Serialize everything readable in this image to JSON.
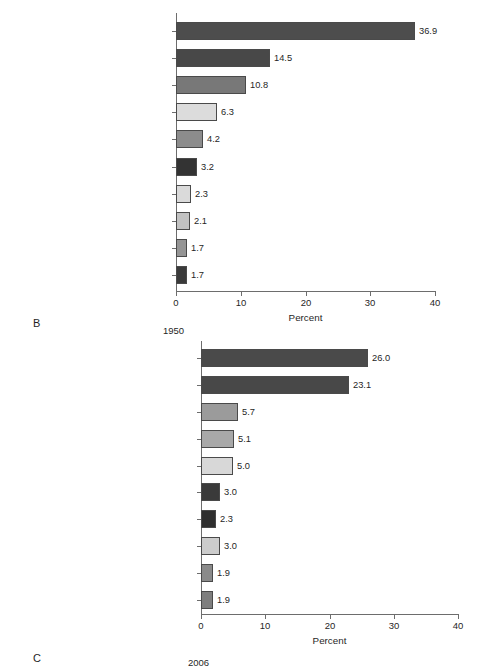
{
  "figure": {
    "panels": [
      {
        "letter": "B",
        "year_caption": "1950",
        "xlabel": "Percent",
        "xticks": [
          "0",
          "10",
          "20",
          "30",
          "40"
        ]
      },
      {
        "letter": "C",
        "year_caption": "2006",
        "xlabel": "Percent",
        "xticks": [
          "0",
          "10",
          "20",
          "30",
          "40"
        ]
      }
    ]
  },
  "chart_data": [
    {
      "type": "bar",
      "orientation": "horizontal",
      "title": "1950",
      "panel_letter": "B",
      "xlabel": "Percent",
      "ylabel": "",
      "xlim": [
        0,
        40
      ],
      "xticks": [
        0,
        10,
        20,
        30,
        40
      ],
      "grid": false,
      "legend": "none",
      "categories": [
        "Disease of the heart",
        "Malignant neoplasms",
        "CNS vascular lesions",
        "Accidents",
        "Certain diseases of early infancy",
        "Influenza and pneumonia",
        "Tuberculosis",
        "General arteriosclerosis",
        "Nephritis and renal sclerosis",
        "Diabetes mellitus"
      ],
      "values": [
        36.9,
        14.5,
        10.8,
        6.3,
        4.2,
        3.2,
        2.3,
        2.1,
        1.7,
        1.7
      ],
      "value_labels": [
        "36.9",
        "14.5",
        "10.8",
        "6.3",
        "4.2",
        "3.2",
        "2.3",
        "2.1",
        "1.7",
        "1.7"
      ],
      "bar_colors": [
        "#4d4d4d",
        "#484848",
        "#787878",
        "#dcdcdc",
        "#8c8c8c",
        "#333333",
        "#dadada",
        "#c2c2c2",
        "#959595",
        "#3a3a3a"
      ]
    },
    {
      "type": "bar",
      "orientation": "horizontal",
      "title": "2006",
      "panel_letter": "C",
      "xlabel": "Percent",
      "ylabel": "",
      "xlim": [
        0,
        40
      ],
      "xticks": [
        0,
        10,
        20,
        30,
        40
      ],
      "grid": false,
      "legend": "none",
      "categories": [
        "Heart diseases",
        "Malignant neoplasms",
        "Cerebrovascular diseases",
        "Chronic lower respiratory diseases",
        "Accidents",
        "Diabetes mellitus",
        "Influenza and pneumonia",
        "Alzheimer's disease",
        "Nephritis, nephrotic syndrome, nephrosis",
        "Septicemia"
      ],
      "values": [
        26.0,
        23.1,
        5.7,
        5.1,
        5.0,
        3.0,
        2.3,
        3.0,
        1.9,
        1.9
      ],
      "value_labels": [
        "26.0",
        "23.1",
        "5.7",
        "5.1",
        "5.0",
        "3.0",
        "2.3",
        "3.0",
        "1.9",
        "1.9"
      ],
      "bar_colors": [
        "#4a4a4a",
        "#484848",
        "#9b9b9b",
        "#a8a8a8",
        "#d8d8d8",
        "#3a3a3a",
        "#2f2f2f",
        "#cccccc",
        "#8a8a8a",
        "#7e7e7e"
      ]
    }
  ]
}
